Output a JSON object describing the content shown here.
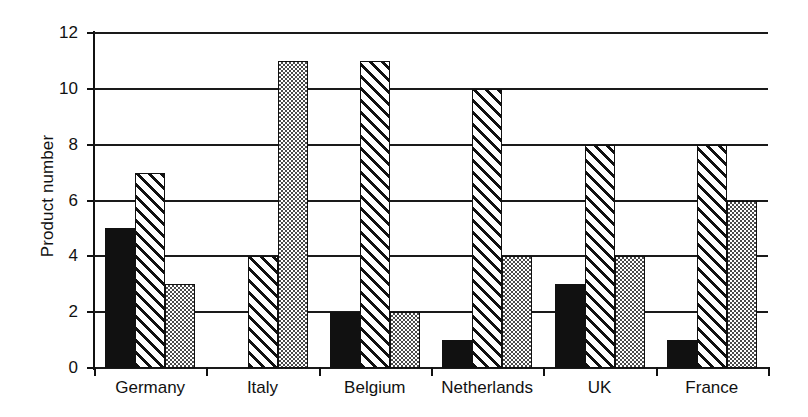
{
  "chart_data": {
    "type": "bar",
    "title": "",
    "xlabel": "",
    "ylabel": "Product number",
    "categories": [
      "Germany",
      "Italy",
      "Belgium",
      "Netherlands",
      "UK",
      "France"
    ],
    "series": [
      {
        "name": "series-1-solid-black",
        "pattern": "solid-black",
        "values": [
          5,
          0,
          2,
          1,
          3,
          1
        ]
      },
      {
        "name": "series-2-diagonal-hatch",
        "pattern": "diagonal-hatch",
        "values": [
          7,
          4,
          11,
          10,
          8,
          8
        ]
      },
      {
        "name": "series-3-checkered",
        "pattern": "checkered-dotted",
        "values": [
          3,
          11,
          2,
          4,
          4,
          6
        ]
      }
    ],
    "ylim": [
      0,
      12
    ],
    "yticks": [
      0,
      2,
      4,
      6,
      8,
      10,
      12
    ],
    "ytick_labels": [
      "0",
      "2",
      "4",
      "6",
      "8",
      "10",
      "12"
    ],
    "grid": true,
    "grid_axis": "y",
    "legend": false,
    "colors": {
      "solid": "#111111",
      "hatch_line": "#111111",
      "checker": "#4a4a4a",
      "background": "#ffffff",
      "axis": "#111111"
    }
  }
}
